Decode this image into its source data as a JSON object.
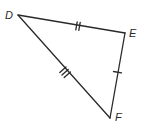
{
  "diagram": {
    "type": "triangle",
    "name": "Triangle DEF",
    "stroke_color": "#2a2a2a",
    "background": "#ffffff",
    "vertices": [
      {
        "label": "D",
        "x": 18,
        "y": 15
      },
      {
        "label": "E",
        "x": 125,
        "y": 33
      },
      {
        "label": "F",
        "x": 110,
        "y": 118
      }
    ],
    "sides": [
      {
        "name": "DE",
        "from": "D",
        "to": "E",
        "tick_marks": 2
      },
      {
        "name": "EF",
        "from": "E",
        "to": "F",
        "tick_marks": 1
      },
      {
        "name": "DF",
        "from": "D",
        "to": "F",
        "tick_marks": 3
      }
    ],
    "labels": {
      "D": "D",
      "E": "E",
      "F": "F"
    }
  }
}
